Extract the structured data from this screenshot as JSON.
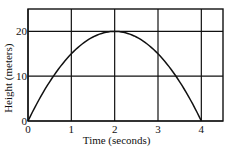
{
  "chart_data": {
    "type": "line",
    "title": "",
    "xlabel": "Time (seconds)",
    "ylabel": "Height (meters)",
    "xlim": [
      0,
      4.5
    ],
    "ylim": [
      0,
      25
    ],
    "x_ticks": [
      0,
      1,
      2,
      3,
      4
    ],
    "x_tick_labels": [
      "0",
      "1",
      "2",
      "3",
      "4"
    ],
    "y_ticks": [
      0,
      10,
      20
    ],
    "y_tick_labels": [
      "0",
      "10",
      "20"
    ],
    "grid": true,
    "legend": null,
    "series": [
      {
        "name": "height",
        "equation": "h = 20t - 5t^2",
        "x": [
          0,
          0.25,
          0.5,
          0.75,
          1,
          1.25,
          1.5,
          1.75,
          2,
          2.25,
          2.5,
          2.75,
          3,
          3.25,
          3.5,
          3.75,
          4
        ],
        "y": [
          0,
          4.6875,
          8.75,
          12.1875,
          15,
          17.1875,
          18.75,
          19.6875,
          20,
          19.6875,
          18.75,
          17.1875,
          15,
          12.1875,
          8.75,
          4.6875,
          0
        ]
      }
    ]
  }
}
